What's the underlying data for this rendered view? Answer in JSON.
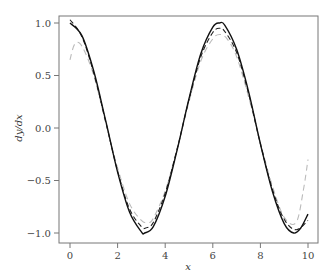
{
  "chart_data": {
    "type": "line",
    "title": "",
    "xlabel": "x",
    "ylabel": "dy/dx",
    "xlim": [
      -0.4,
      10.4
    ],
    "ylim": [
      -1.08,
      1.08
    ],
    "grid": false,
    "legend": null,
    "x_ticks": [
      0,
      2,
      4,
      6,
      8,
      10
    ],
    "x_tick_labels": [
      "0",
      "2",
      "4",
      "6",
      "8",
      "10"
    ],
    "y_ticks": [
      1.0,
      0.5,
      0.0,
      -0.5,
      -1.0
    ],
    "y_tick_labels": [
      "1.0",
      "0.5",
      "0.0",
      "−0.5",
      "−1.0"
    ],
    "series": [
      {
        "name": "true derivative",
        "style": "solid",
        "color": "#111111",
        "x": [
          0,
          0.5,
          1,
          1.5,
          2,
          2.5,
          3,
          3.14,
          3.5,
          4,
          4.5,
          5,
          5.5,
          6,
          6.28,
          6.5,
          7,
          7.5,
          8,
          8.5,
          9,
          9.4,
          9.7,
          10
        ],
        "y": [
          1.0,
          0.88,
          0.54,
          0.07,
          -0.42,
          -0.8,
          -0.99,
          -1.0,
          -0.94,
          -0.65,
          -0.21,
          0.28,
          0.71,
          0.96,
          1.0,
          0.98,
          0.75,
          0.35,
          -0.15,
          -0.6,
          -0.91,
          -1.0,
          -0.95,
          -0.82
        ]
      },
      {
        "name": "estimate 1",
        "style": "dashed",
        "color": "#222222",
        "x": [
          0,
          0.5,
          1,
          1.5,
          2,
          2.5,
          3,
          3.2,
          3.5,
          4,
          4.5,
          5,
          5.5,
          6,
          6.3,
          6.5,
          7,
          7.5,
          8,
          8.5,
          9,
          9.5,
          10
        ],
        "y": [
          1.03,
          0.87,
          0.52,
          0.06,
          -0.41,
          -0.77,
          -0.94,
          -0.95,
          -0.9,
          -0.62,
          -0.2,
          0.27,
          0.68,
          0.91,
          0.95,
          0.92,
          0.72,
          0.33,
          -0.15,
          -0.58,
          -0.87,
          -0.97,
          -0.88
        ]
      },
      {
        "name": "estimate 2",
        "style": "dashed",
        "color": "#bbbbbb",
        "x": [
          0,
          0.2,
          0.5,
          1,
          1.5,
          2,
          2.5,
          3,
          3.3,
          3.5,
          4,
          4.5,
          5,
          5.5,
          6,
          6.3,
          6.6,
          7,
          7.5,
          8,
          8.5,
          9,
          9.5,
          9.8,
          10
        ],
        "y": [
          0.65,
          0.8,
          0.78,
          0.5,
          0.05,
          -0.38,
          -0.72,
          -0.88,
          -0.9,
          -0.86,
          -0.6,
          -0.2,
          0.25,
          0.64,
          0.85,
          0.89,
          0.85,
          0.68,
          0.3,
          -0.14,
          -0.55,
          -0.85,
          -0.9,
          -0.6,
          -0.3
        ]
      }
    ]
  }
}
